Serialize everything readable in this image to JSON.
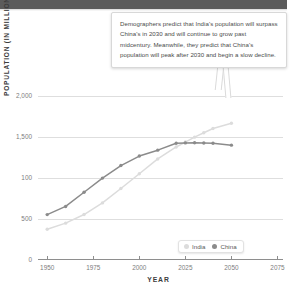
{
  "header": {
    "title": ""
  },
  "callout": {
    "text": "Demographers predict that India's population will surpass China's in 2030 and will continue to grow past midcentury. Meanwhile, they predict that China's population will peak after 2030 and begin a slow decline."
  },
  "legend": {
    "position": "bottom-right",
    "items": [
      {
        "label": "India",
        "color": "#dcdcdc"
      },
      {
        "label": "China",
        "color": "#8b8b8b"
      }
    ]
  },
  "colors": {
    "india": "#dcdcdc",
    "china": "#8b8b8b",
    "grid": "#dedede",
    "axis": "#8e8e8e",
    "header_bar": "#5b5b5b",
    "text": "#4a4a4a"
  },
  "chart_data": {
    "type": "line",
    "title": "",
    "xlabel": "YEAR",
    "ylabel": "POPULATION (IN MILLIONS)",
    "xlim": [
      1945,
      2078
    ],
    "ylim": [
      0,
      2100
    ],
    "grid": true,
    "xticks": [
      1950,
      1975,
      2000,
      2025,
      2050,
      2075
    ],
    "xtick_labels": [
      "1950",
      "1975",
      "2000",
      "2025",
      "2050",
      "2075"
    ],
    "yticks": [
      0,
      500,
      1000,
      1500,
      2000
    ],
    "ytick_labels": [
      "0",
      "500",
      "100",
      "1,500",
      "2,000"
    ],
    "legend_position": "lower right",
    "series": [
      {
        "name": "China",
        "color": "#8b8b8b",
        "x": [
          1950,
          1960,
          1970,
          1980,
          1990,
          2000,
          2010,
          2020,
          2025,
          2030,
          2035,
          2040,
          2050
        ],
        "values": [
          554,
          654,
          827,
          1000,
          1153,
          1269,
          1341,
          1425,
          1430,
          1432,
          1428,
          1425,
          1402
        ]
      },
      {
        "name": "India",
        "color": "#dcdcdc",
        "x": [
          1950,
          1960,
          1970,
          1980,
          1990,
          2000,
          2010,
          2020,
          2025,
          2030,
          2035,
          2040,
          2050
        ],
        "values": [
          376,
          450,
          555,
          697,
          873,
          1053,
          1234,
          1380,
          1440,
          1500,
          1553,
          1605,
          1670
        ]
      }
    ]
  }
}
